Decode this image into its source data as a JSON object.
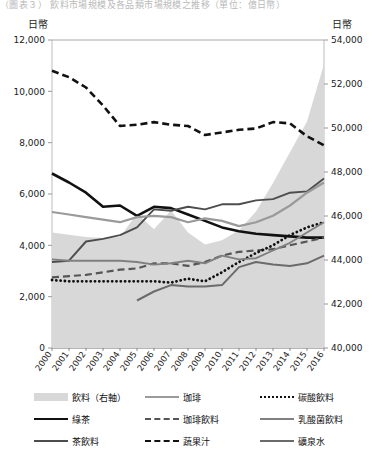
{
  "top_caption": "（圖表３） 飲料市場規模及各品類市場規模之推移（單位：億日幣）",
  "axis": {
    "left_unit": "日幣",
    "right_unit": "日幣",
    "left_ticks": [
      "12,000",
      "10,000",
      "8,000",
      "6,000",
      "4,000",
      "2,000",
      "0"
    ],
    "right_ticks": [
      "54,000",
      "52,000",
      "50,000",
      "48,000",
      "46,000",
      "44,000",
      "42,000",
      "40,000"
    ]
  },
  "legend": {
    "rows": [
      [
        {
          "label": "飲料（右軸）",
          "style": "area",
          "color": "#d8d8d8"
        },
        {
          "label": "珈琲",
          "style": "line",
          "color": "#9a9a9a"
        },
        {
          "label": "碳酸飲料",
          "style": "dotted",
          "color": "#111111"
        }
      ],
      [
        {
          "label": "綠茶",
          "style": "thick",
          "color": "#111111"
        },
        {
          "label": "珈琲飲料",
          "style": "dashed",
          "color": "#555555"
        },
        {
          "label": "乳酸菌飲料",
          "style": "line",
          "color": "#808080"
        }
      ],
      [
        {
          "label": "茶飲料",
          "style": "line",
          "color": "#4d4d4d"
        },
        {
          "label": "蔬果汁",
          "style": "dashed",
          "color": "#111111"
        },
        {
          "label": "礦泉水",
          "style": "line",
          "color": "#6b6b6b"
        }
      ]
    ]
  },
  "chart_data": {
    "type": "line",
    "title": "飲料市場規模及各品類市場規模之推移",
    "xlabel": "",
    "ylabel": "日幣",
    "y2label": "日幣",
    "ylim": [
      0,
      12000
    ],
    "y2lim": [
      40000,
      54000
    ],
    "grid": false,
    "legend_position": "bottom",
    "categories": [
      2000,
      2001,
      2002,
      2003,
      2004,
      2005,
      2006,
      2007,
      2008,
      2009,
      2010,
      2011,
      2012,
      2013,
      2014,
      2015,
      2016
    ],
    "x_tick_labels": [
      "2000",
      "2001",
      "2002",
      "2003",
      "2004",
      "2005",
      "2006",
      "2007",
      "2008",
      "2009",
      "2010",
      "2011",
      "2012",
      "2013",
      "2014",
      "2015",
      "2016"
    ],
    "series": [
      {
        "name": "飲料（右軸）",
        "axis": "right",
        "type": "area",
        "color": "#d8d8d8",
        "values": [
          45250,
          45150,
          45050,
          45000,
          45050,
          46100,
          45400,
          46250,
          45250,
          44700,
          44900,
          45350,
          46200,
          47500,
          48900,
          50300,
          52900
        ]
      },
      {
        "name": "綠茶",
        "axis": "left",
        "type": "line",
        "style": "solid",
        "color": "#111111",
        "width": 2.6,
        "values": [
          6800,
          6450,
          6050,
          5500,
          5550,
          5150,
          5500,
          5450,
          5200,
          4950,
          4700,
          4550,
          4450,
          4400,
          4350,
          4300,
          4300
        ]
      },
      {
        "name": "茶飲料",
        "axis": "left",
        "type": "line",
        "style": "solid",
        "color": "#4d4d4d",
        "width": 1.9,
        "values": [
          3350,
          3400,
          4150,
          4250,
          4400,
          4700,
          5400,
          5350,
          5500,
          5400,
          5600,
          5600,
          5750,
          5800,
          6050,
          6100,
          6600
        ]
      },
      {
        "name": "珈琲",
        "axis": "left",
        "type": "line",
        "style": "solid",
        "color": "#9a9a9a",
        "width": 2.2,
        "values": [
          5300,
          5200,
          5100,
          5000,
          4900,
          5100,
          5150,
          5100,
          4900,
          5050,
          4950,
          4750,
          4900,
          5150,
          5550,
          6050,
          6450
        ]
      },
      {
        "name": "珈琲飲料",
        "axis": "left",
        "type": "line",
        "style": "dashed",
        "color": "#555555",
        "width": 2.2,
        "values": [
          2750,
          2800,
          2850,
          2950,
          3050,
          3100,
          3300,
          3300,
          3200,
          3350,
          3600,
          3750,
          3800,
          3850,
          4000,
          4150,
          4300
        ]
      },
      {
        "name": "蔬果汁",
        "axis": "left",
        "type": "line",
        "style": "dashed",
        "color": "#111111",
        "width": 2.6,
        "values": [
          10800,
          10550,
          10150,
          9450,
          8650,
          8700,
          8800,
          8700,
          8650,
          8300,
          8400,
          8500,
          8550,
          8800,
          8750,
          8250,
          7900
        ]
      },
      {
        "name": "碳酸飲料",
        "axis": "left",
        "type": "line",
        "style": "dotted",
        "color": "#111111",
        "width": 2.8,
        "values": [
          2650,
          2600,
          2600,
          2600,
          2600,
          2600,
          2600,
          2550,
          2700,
          2600,
          2950,
          3350,
          3700,
          4000,
          4400,
          4700,
          4900
        ]
      },
      {
        "name": "乳酸菌飲料",
        "axis": "left",
        "type": "line",
        "style": "solid",
        "color": "#808080",
        "width": 1.9,
        "values": [
          3450,
          3400,
          3400,
          3400,
          3400,
          3350,
          3250,
          3300,
          3400,
          3300,
          3600,
          3450,
          3500,
          3800,
          4100,
          4500,
          4900
        ]
      },
      {
        "name": "礦泉水",
        "axis": "left",
        "type": "line",
        "style": "solid",
        "color": "#6b6b6b",
        "width": 2.0,
        "values": [
          null,
          null,
          null,
          null,
          null,
          1850,
          2200,
          2450,
          2400,
          2400,
          2450,
          3150,
          3350,
          3250,
          3200,
          3300,
          3600
        ]
      }
    ]
  }
}
